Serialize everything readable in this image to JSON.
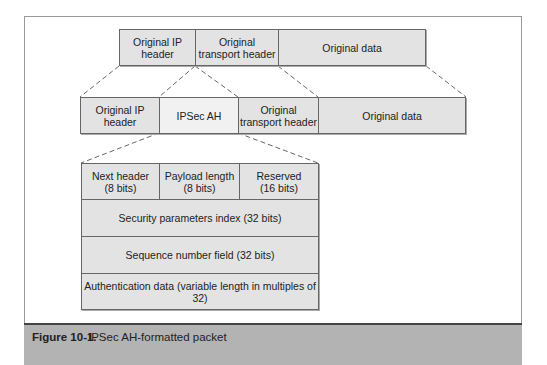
{
  "diagram": {
    "title": "IPSec AH-formatted packet",
    "original_packet": [
      {
        "label": "Original IP header"
      },
      {
        "label": "Original transport header"
      },
      {
        "label": "Original data"
      }
    ],
    "ah_packet": [
      {
        "label": "Original IP header"
      },
      {
        "label": "IPSec AH"
      },
      {
        "label": "Original transport header"
      },
      {
        "label": "Original data"
      }
    ],
    "ah_header": {
      "row1": [
        {
          "label": "Next header",
          "bits": "(8 bits)"
        },
        {
          "label": "Payload length",
          "bits": "(8 bits)"
        },
        {
          "label": "Reserved",
          "bits": "(16 bits)"
        }
      ],
      "rows": [
        "Security parameters index (32 bits)",
        "Sequence number field (32 bits)",
        "Authentication data (variable length in multiples of 32)"
      ]
    }
  },
  "caption": {
    "number": "Figure 10-1.",
    "text": "IPSec AH-formatted packet"
  },
  "colors": {
    "box_fill": "#e3e3e3",
    "ah_fill": "#f1f1f1",
    "caption_band": "#b3b3b3"
  }
}
